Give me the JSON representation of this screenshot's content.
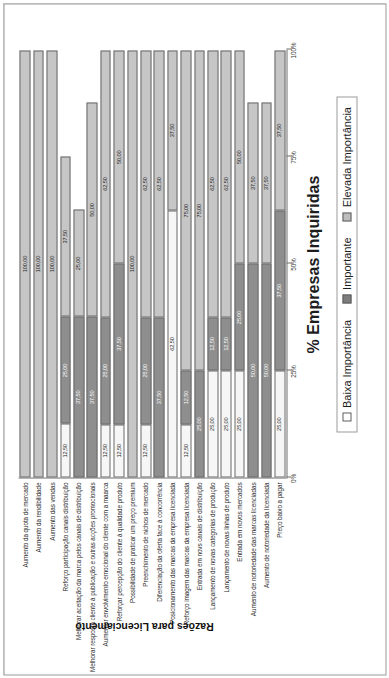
{
  "chart_data": {
    "type": "bar",
    "subtype": "stacked-horizontal-bar",
    "title": "",
    "xlabel": "% Empresas Inquiridas",
    "ylabel": "Razões para Licenciamento",
    "xlim": [
      0,
      100
    ],
    "xticks": [
      0,
      25,
      50,
      75,
      100
    ],
    "xtick_labels": [
      "0%",
      "25%",
      "50%",
      "75%",
      "100%"
    ],
    "grid": false,
    "legend_position": "bottom",
    "stack_order": [
      "Baixa Importância",
      "Importante",
      "Elevada Importância"
    ],
    "series": [
      {
        "name": "Baixa Importância",
        "color": "#f6f6f6",
        "values": [
          0,
          0,
          0,
          12.5,
          0,
          0,
          12.5,
          12.5,
          0,
          12.5,
          0,
          62.5,
          12.5,
          0,
          25.0,
          25.0,
          25.0,
          0,
          0,
          25.0
        ]
      },
      {
        "name": "Importante",
        "color": "#8e8e8e",
        "values": [
          0,
          0,
          0,
          25.0,
          37.5,
          37.5,
          25.0,
          37.5,
          0,
          25.0,
          37.5,
          0,
          12.5,
          25.0,
          12.5,
          12.5,
          25.0,
          50.0,
          50.0,
          37.5
        ]
      },
      {
        "name": "Elevada Importância",
        "color": "#c6c6c6",
        "values": [
          100.0,
          100.0,
          100.0,
          37.5,
          25.0,
          50.0,
          62.5,
          50.0,
          100.0,
          62.5,
          62.5,
          37.5,
          75.0,
          75.0,
          62.5,
          62.5,
          50.0,
          37.5,
          37.5,
          37.5
        ]
      }
    ],
    "categories": [
      "Aumento da quota de mercado",
      "Aumento da rendibilidade",
      "Aumento das vendas",
      "Reforço participação canais distribuição",
      "Melhorar aceitação da marca pelos canais de distribuição",
      "Melhorar resposta cliente à publicação e outras acções promocionais",
      "Aumentar envolvimento emocional do cliente com a maarca",
      "Reforçar percepção do cliente à qualidade produto",
      "Possibilidade de praticar um preço premium",
      "Preenchimento de nichos de mercado",
      "Diferenciação da oferta face à concorrência",
      "Posicionamento das marcas da empresa licenciada",
      "Reforço imagem das marcas da empresa licenciada",
      "Entrada em novs canais de distribuição",
      "Lançamento de novas categorias de produção",
      "Lançamento de novas linhas de produto",
      "Entrada em novos mercados",
      "Aumento de notoriedade das marcas licenciadas",
      "Aumento de notoriedade da licenciada",
      "Preço baixo a pagar"
    ],
    "bar_labels": [
      [
        null,
        null,
        "100,00"
      ],
      [
        null,
        null,
        "100,00"
      ],
      [
        null,
        null,
        "100,00"
      ],
      [
        "12,50",
        "25,00",
        "37,50"
      ],
      [
        null,
        "37,50",
        "25,00"
      ],
      [
        null,
        "37,50",
        "50,00"
      ],
      [
        "12,50",
        "25,00",
        "62,50"
      ],
      [
        "12,50",
        "37,50",
        "50,00"
      ],
      [
        null,
        null,
        "100,00"
      ],
      [
        "12,50",
        "25,00",
        "62,50"
      ],
      [
        null,
        "37,50",
        "62,50"
      ],
      [
        "62,50",
        null,
        "37,50"
      ],
      [
        "12,50",
        "12,50",
        "75,00"
      ],
      [
        null,
        "25,00",
        "75,00"
      ],
      [
        "25,00",
        "12,50",
        "62,50"
      ],
      [
        "25,00",
        "12,50",
        "62,50"
      ],
      [
        "25,00",
        "25,00",
        "50,00"
      ],
      [
        null,
        "50,00",
        "37,50"
      ],
      [
        null,
        "50,00",
        "37,50"
      ],
      [
        "25,00",
        "37,50",
        "37,50"
      ]
    ]
  },
  "legend": {
    "items": [
      {
        "label": "Baixa Importância",
        "swatch": "baixa"
      },
      {
        "label": "Importante",
        "swatch": "imp"
      },
      {
        "label": "Elevada Importância",
        "swatch": "elev"
      }
    ]
  },
  "axis": {
    "x_title": "% Empresas Inquiridas",
    "y_title": "Razões para Licenciamento"
  }
}
